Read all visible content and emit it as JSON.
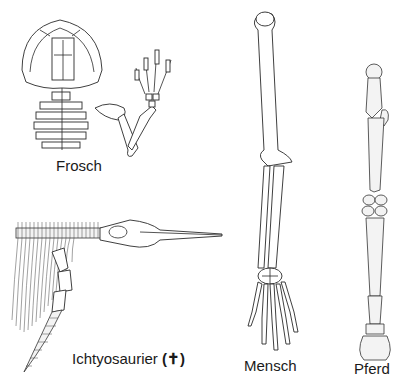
{
  "diagram": {
    "topic": "homologous forelimb skeletons",
    "specimens": [
      {
        "id": "frosch",
        "label": "Frosch"
      },
      {
        "id": "ichtyosaurier",
        "label": "Ichtyosaurier",
        "extinct_marker": "(✝)"
      },
      {
        "id": "mensch",
        "label": "Mensch"
      },
      {
        "id": "pferd",
        "label": "Pferd"
      }
    ]
  }
}
